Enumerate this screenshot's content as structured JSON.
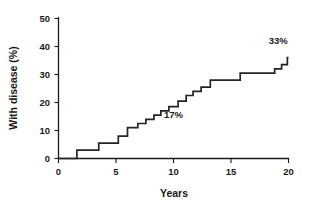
{
  "chart_data": {
    "type": "line",
    "subtype": "step-cumulative-incidence",
    "title": "",
    "xlabel": "Years",
    "ylabel": "With disease (%)",
    "xlim": [
      0,
      20
    ],
    "ylim": [
      0,
      50
    ],
    "xticks": [
      0,
      5,
      10,
      15,
      20
    ],
    "yticks": [
      0,
      10,
      20,
      30,
      40,
      50
    ],
    "xtick_labels": [
      "0",
      "5",
      "10",
      "15",
      "20"
    ],
    "ytick_labels": [
      "0",
      "10",
      "20",
      "30",
      "40",
      "50"
    ],
    "grid": false,
    "legend": null,
    "legend_position": "none",
    "series": [
      {
        "name": "Cumulative incidence",
        "color": "#242424",
        "step": "post",
        "x": [
          0,
          1.6,
          3.5,
          5.2,
          6.0,
          6.9,
          7.6,
          8.3,
          8.9,
          9.6,
          10.4,
          11.1,
          11.7,
          12.4,
          13.2,
          15.8,
          18.8,
          19.4,
          19.9,
          20.0
        ],
        "y": [
          0,
          3,
          5.5,
          8,
          11,
          12.5,
          14,
          15.5,
          17,
          18.5,
          20.5,
          22.5,
          24,
          25.5,
          28,
          30.5,
          32,
          33.5,
          36,
          36
        ]
      }
    ],
    "annotations": [
      {
        "text": "17%",
        "x": 10.0,
        "y": 14.5,
        "label": "17-percent-callout"
      },
      {
        "text": "33%",
        "x": 19.1,
        "y": 41.0,
        "label": "33-percent-callout"
      }
    ],
    "colors": {
      "line": "#242424",
      "axis": "#1a1a1a",
      "background": "#ffffff"
    }
  }
}
